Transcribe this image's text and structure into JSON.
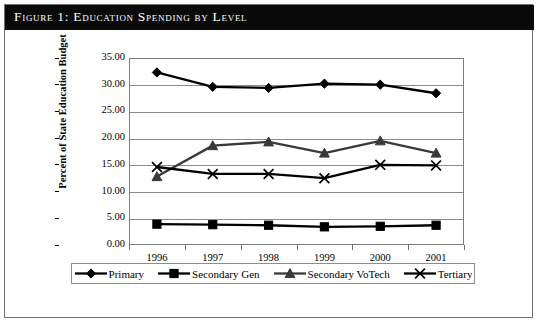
{
  "figure": {
    "caption": "Figure 1: Education Spending by Level"
  },
  "chart_data": {
    "type": "line",
    "title": "Figure 1: Education Spending by Level",
    "xlabel": "",
    "ylabel": "Percent of State Education Budget",
    "categories": [
      "1996",
      "1997",
      "1998",
      "1999",
      "2000",
      "2001"
    ],
    "ylim": [
      0.0,
      35.0
    ],
    "ytick_step": 5.0,
    "ytick_labels": [
      "0.00",
      "5.00",
      "10.00",
      "15.00",
      "20.00",
      "25.00",
      "30.00",
      "35.00"
    ],
    "grid": true,
    "legend_position": "bottom",
    "series": [
      {
        "name": "Primary",
        "marker": "diamond",
        "color": "#000000",
        "values": [
          32.3,
          29.6,
          29.4,
          30.2,
          30.0,
          28.4
        ]
      },
      {
        "name": "Secondary Gen",
        "marker": "square",
        "color": "#000000",
        "values": [
          3.9,
          3.8,
          3.7,
          3.4,
          3.5,
          3.7
        ]
      },
      {
        "name": "Secondary VoTech",
        "marker": "triangle",
        "color": "#3a3a3a",
        "values": [
          12.8,
          18.6,
          19.3,
          17.2,
          19.5,
          17.2
        ]
      },
      {
        "name": "Tertiary",
        "marker": "x",
        "color": "#000000",
        "values": [
          14.6,
          13.3,
          13.3,
          12.5,
          15.0,
          14.9
        ]
      }
    ]
  },
  "ylabels": {
    "t0": "0.00",
    "t1": "5.00",
    "t2": "10.00",
    "t3": "15.00",
    "t4": "20.00",
    "t5": "25.00",
    "t6": "30.00",
    "t7": "35.00"
  },
  "xlabels": {
    "c0": "1996",
    "c1": "1997",
    "c2": "1998",
    "c3": "1999",
    "c4": "2000",
    "c5": "2001"
  },
  "legend": {
    "items": [
      {
        "label": "Primary",
        "marker": "diamond"
      },
      {
        "label": "Secondary Gen",
        "marker": "square"
      },
      {
        "label": "Secondary VoTech",
        "marker": "triangle"
      },
      {
        "label": "Tertiary",
        "marker": "x"
      }
    ]
  },
  "axis_title": {
    "y": "Percent of State Education Budget"
  }
}
